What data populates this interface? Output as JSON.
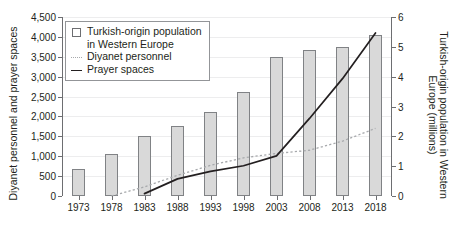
{
  "chart_data": {
    "type": "bar",
    "title": "",
    "categories": [
      "1973",
      "1978",
      "1983",
      "1988",
      "1993",
      "1998",
      "2003",
      "2008",
      "2013",
      "2018"
    ],
    "xlabel": "",
    "ylabel": "Diyanet personnel and prayer spaces",
    "y2label": "Turkish-origin population in Western Europe (millions)",
    "ylim": [
      0,
      4500
    ],
    "y2lim": [
      0,
      6
    ],
    "yticks": [
      "0",
      "500",
      "1,000",
      "1,500",
      "2,000",
      "2,500",
      "3,000",
      "3,500",
      "4,000",
      "4,500"
    ],
    "ytick_values": [
      0,
      500,
      1000,
      1500,
      2000,
      2500,
      3000,
      3500,
      4000,
      4500
    ],
    "y2ticks": [
      "0",
      "1",
      "2",
      "3",
      "4",
      "5",
      "6"
    ],
    "y2tick_values": [
      0,
      1,
      2,
      3,
      4,
      5,
      6
    ],
    "grid": true,
    "legend_position": "top-left",
    "series": [
      {
        "name": "Turkish-origin population in Western Europe",
        "type": "bar",
        "axis": "right",
        "unit": "millions",
        "values": [
          0.9,
          1.4,
          2.0,
          2.35,
          2.8,
          3.5,
          4.65,
          4.9,
          5.0,
          5.4
        ],
        "left_axis_equivalent": [
          675,
          1050,
          1490,
          1765,
          2100,
          2620,
          3490,
          3670,
          3750,
          4060
        ]
      },
      {
        "name": "Diyanet personnel",
        "type": "line",
        "style": "dotted",
        "axis": "left",
        "x": [
          "1978",
          "1983",
          "1988",
          "1993",
          "1998",
          "2003",
          "2008",
          "2013",
          "2018"
        ],
        "values": [
          0,
          230,
          520,
          770,
          960,
          1070,
          1150,
          1380,
          1700
        ]
      },
      {
        "name": "Prayer spaces",
        "type": "line",
        "style": "solid",
        "axis": "left",
        "x": [
          "1983",
          "1988",
          "1993",
          "1998",
          "2003",
          "2008",
          "2013",
          "2018"
        ],
        "values": [
          60,
          430,
          620,
          760,
          1010,
          1950,
          2950,
          4100
        ]
      }
    ]
  },
  "legend": {
    "items": [
      {
        "label_line1": "Turkish-origin population",
        "label_line2": "in Western Europe",
        "key": "square-marker"
      },
      {
        "label_line1": "Diyanet personnel",
        "label_line2": "",
        "key": "dotted-line-marker"
      },
      {
        "label_line1": "Prayer spaces",
        "label_line2": "",
        "key": "solid-line-marker"
      }
    ]
  },
  "colors": {
    "bar_fill": "#d9d9d9",
    "bar_stroke": "#808285",
    "dotted_line": "#a7a9ac",
    "solid_line": "#231f20",
    "axis": "#6d6e71",
    "grid": "#ededee",
    "text": "#231f20",
    "background": "#ffffff"
  }
}
